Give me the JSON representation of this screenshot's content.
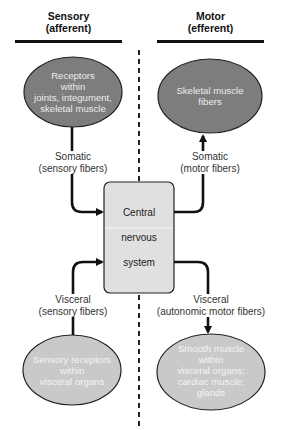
{
  "headers": {
    "sensory": {
      "line1": "Sensory",
      "line2": "(afferent)"
    },
    "motor": {
      "line1": "Motor",
      "line2": "(efferent)"
    }
  },
  "nodes": {
    "somatic_receptors": {
      "lines": [
        "Receptors",
        "within",
        "joints, integument,",
        "skeletal muscle"
      ]
    },
    "skeletal_muscle": {
      "lines": [
        "Skeletal muscle",
        "fibers"
      ]
    },
    "cns": {
      "lines": [
        "Central",
        "nervous",
        "system"
      ]
    },
    "visceral_receptors": {
      "lines": [
        "Sensory receptors",
        "within",
        "visceral organs"
      ]
    },
    "smooth_muscle": {
      "lines": [
        "Smooth muscle",
        "within",
        "visceral organs;",
        "cardiac muscle;",
        "glands"
      ]
    }
  },
  "edges": {
    "somatic_sensory": {
      "line1": "Somatic",
      "line2": "(sensory fibers)"
    },
    "somatic_motor": {
      "line1": "Somatic",
      "line2": "(motor fibers)"
    },
    "visceral_sensory": {
      "line1": "Visceral",
      "line2": "(sensory fibers)"
    },
    "visceral_motor": {
      "line1": "Visceral",
      "line2": "(autonomic motor fibers)"
    }
  },
  "colors": {
    "dark_oval": "#7d7d7d",
    "light_oval": "#c9c9c9",
    "cns_box": "#e0e0e0",
    "line": "#111111"
  }
}
